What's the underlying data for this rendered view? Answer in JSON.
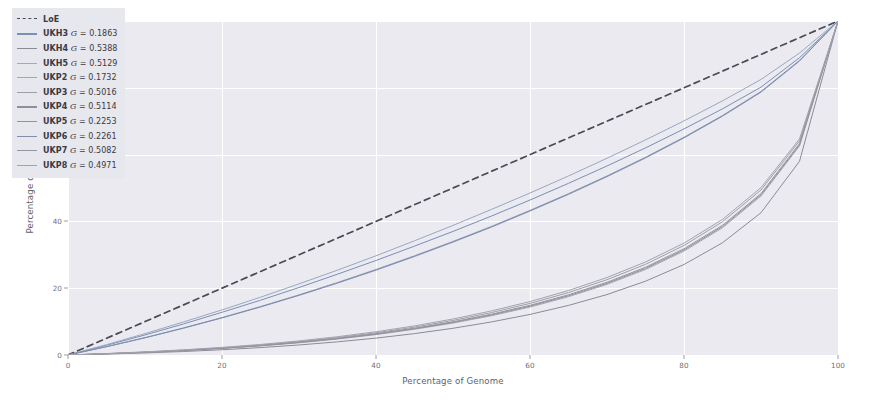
{
  "chart_data": {
    "type": "line",
    "title": "",
    "xlabel": "Percentage of Genome",
    "ylabel": "Percentage of Reads",
    "xlim": [
      0,
      100
    ],
    "ylim": [
      0,
      100
    ],
    "xticks": [
      0,
      20,
      40,
      60,
      80,
      100
    ],
    "yticks": [
      0,
      20,
      40,
      60,
      80,
      100
    ],
    "xtick_labels": [
      "0",
      "20",
      "40",
      "60",
      "80",
      "100"
    ],
    "ytick_labels": [
      "0",
      "20",
      "40",
      "60",
      "80",
      "100"
    ],
    "grid": true,
    "legend_position": "upper left",
    "plot_style": "seaborn-darkgrid",
    "annotation": "Lorenz curves of read coverage versus genome fraction; dashed line is the line of equality.",
    "x": [
      0,
      5,
      10,
      15,
      20,
      25,
      30,
      35,
      40,
      45,
      50,
      55,
      60,
      65,
      70,
      75,
      80,
      85,
      90,
      95,
      100
    ],
    "series": [
      {
        "name": "LoE",
        "label": "LoE",
        "gini": null,
        "color": "#4a4a52",
        "style": "dashed",
        "values": [
          0,
          5,
          10,
          15,
          20,
          25,
          30,
          35,
          40,
          45,
          50,
          55,
          60,
          65,
          70,
          75,
          80,
          85,
          90,
          95,
          100
        ]
      },
      {
        "name": "UKH3",
        "label": "UKH3",
        "gini": 0.1863,
        "gini_text": "0.1863",
        "color": "#7b8fb5",
        "style": "solid",
        "values": [
          0,
          2.9,
          6.0,
          9.3,
          12.8,
          16.4,
          20.2,
          24.2,
          28.3,
          32.6,
          37.0,
          41.6,
          46.4,
          51.4,
          56.6,
          62.0,
          67.7,
          73.7,
          80.2,
          89.0,
          100
        ]
      },
      {
        "name": "UKH4",
        "label": "UKH4",
        "gini": 0.5388,
        "gini_text": "0.5388",
        "color": "#8b8b96",
        "style": "solid",
        "values": [
          0,
          0.28,
          0.62,
          1.05,
          1.58,
          2.22,
          3.0,
          3.94,
          5.06,
          6.4,
          8.0,
          9.9,
          12.15,
          14.85,
          18.1,
          22.1,
          27.1,
          33.6,
          42.6,
          58.0,
          100
        ]
      },
      {
        "name": "UKH5",
        "label": "UKH5",
        "gini": 0.5129,
        "gini_text": "0.5129",
        "color": "#a9a9b3",
        "style": "solid",
        "values": [
          0,
          0.35,
          0.78,
          1.3,
          1.95,
          2.72,
          3.65,
          4.78,
          6.1,
          7.7,
          9.55,
          11.75,
          14.35,
          17.45,
          21.15,
          25.6,
          31.1,
          38.1,
          47.6,
          62.6,
          100
        ]
      },
      {
        "name": "UKP2",
        "label": "UKP2",
        "gini": 0.1732,
        "gini_text": "0.1732",
        "color": "#9aa7c0",
        "style": "solid",
        "values": [
          0,
          3.1,
          6.4,
          9.9,
          13.5,
          17.3,
          21.3,
          25.4,
          29.7,
          34.2,
          38.8,
          43.6,
          48.5,
          53.6,
          58.9,
          64.4,
          70.1,
          76.1,
          82.5,
          90.4,
          100
        ]
      },
      {
        "name": "UKP3",
        "label": "UKP3",
        "gini": 0.5016,
        "gini_text": "0.5016",
        "color": "#9e9ea9",
        "style": "solid",
        "values": [
          0,
          0.4,
          0.88,
          1.46,
          2.16,
          3.0,
          4.02,
          5.22,
          6.65,
          8.35,
          10.35,
          12.7,
          15.45,
          18.7,
          22.55,
          27.15,
          32.8,
          39.9,
          49.4,
          64.1,
          100
        ]
      },
      {
        "name": "UKP4",
        "label": "UKP4",
        "gini": 0.5114,
        "gini_text": "0.5114",
        "color": "#8f8f9a",
        "style": "solid",
        "values": [
          0,
          0.36,
          0.8,
          1.34,
          2.0,
          2.79,
          3.74,
          4.88,
          6.24,
          7.86,
          9.75,
          11.99,
          14.62,
          17.74,
          21.45,
          25.93,
          31.45,
          38.45,
          47.95,
          62.9,
          100
        ]
      },
      {
        "name": "UKP5",
        "label": "UKP5",
        "gini": 0.2253,
        "gini_text": "0.2253",
        "color": "#8795b4",
        "style": "solid",
        "values": [
          0,
          2.5,
          5.2,
          8.1,
          11.2,
          14.5,
          18.0,
          21.7,
          25.6,
          29.7,
          34.0,
          38.5,
          43.3,
          48.3,
          53.6,
          59.2,
          65.2,
          71.7,
          78.9,
          88.2,
          100
        ]
      },
      {
        "name": "UKP6",
        "label": "UKP6",
        "gini": 0.2261,
        "gini_text": "0.2261",
        "color": "#7f8eae",
        "style": "solid",
        "values": [
          0,
          2.48,
          5.15,
          8.03,
          11.1,
          14.38,
          17.85,
          21.52,
          25.4,
          29.5,
          33.8,
          38.3,
          43.1,
          48.1,
          53.4,
          59.0,
          65.0,
          71.5,
          78.7,
          88.0,
          100
        ]
      },
      {
        "name": "UKP7",
        "label": "UKP7",
        "gini": 0.5082,
        "gini_text": "0.5082",
        "color": "#95959f",
        "style": "solid",
        "values": [
          0,
          0.37,
          0.83,
          1.38,
          2.05,
          2.86,
          3.83,
          5.0,
          6.38,
          8.02,
          9.95,
          12.22,
          14.88,
          18.02,
          21.77,
          26.27,
          31.82,
          38.82,
          48.32,
          63.3,
          100
        ]
      },
      {
        "name": "UKP8",
        "label": "UKP8",
        "gini": 0.4971,
        "gini_text": "0.4971",
        "color": "#a3a3ad",
        "style": "solid",
        "values": [
          0,
          0.43,
          0.94,
          1.55,
          2.28,
          3.16,
          4.22,
          5.48,
          6.96,
          8.72,
          10.78,
          13.2,
          16.0,
          19.3,
          23.2,
          27.85,
          33.5,
          40.6,
          50.1,
          64.7,
          100
        ]
      }
    ]
  },
  "legend": {
    "entries": [
      {
        "label": "LoE",
        "gini_prefix": "",
        "gini_text": ""
      },
      {
        "label": "UKH3",
        "gini_prefix": " = ",
        "gini_text": "0.1863"
      },
      {
        "label": "UKH4",
        "gini_prefix": " = ",
        "gini_text": "0.5388"
      },
      {
        "label": "UKH5",
        "gini_prefix": " = ",
        "gini_text": "0.5129"
      },
      {
        "label": "UKP2",
        "gini_prefix": " = ",
        "gini_text": "0.1732"
      },
      {
        "label": "UKP3",
        "gini_prefix": " = ",
        "gini_text": "0.5016"
      },
      {
        "label": "UKP4",
        "gini_prefix": " = ",
        "gini_text": "0.5114"
      },
      {
        "label": "UKP5",
        "gini_prefix": " = ",
        "gini_text": "0.2253"
      },
      {
        "label": "UKP6",
        "gini_prefix": " = ",
        "gini_text": "0.2261"
      },
      {
        "label": "UKP7",
        "gini_prefix": " = ",
        "gini_text": "0.5082"
      },
      {
        "label": "UKP8",
        "gini_prefix": " = ",
        "gini_text": "0.4971"
      }
    ],
    "gini_symbol": "G"
  },
  "colors": {
    "plot_background": "#eaeaf0",
    "figure_background": "#ffffff",
    "gridline": "#ffffff",
    "tick_label": "#70707a",
    "axis_label": "#5f5f68",
    "legend_background": "#e7e7ee",
    "legend_text": "#3a3a42",
    "loe_line": "#4a4a52"
  }
}
